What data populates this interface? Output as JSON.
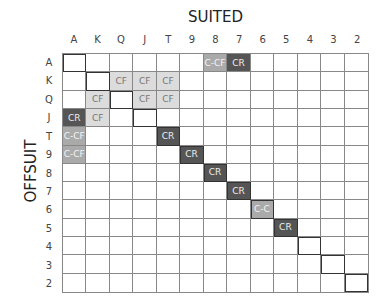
{
  "title_top": "SUITED",
  "title_left": "OFFSUIT",
  "ranks": [
    "A",
    "K",
    "Q",
    "J",
    "T",
    "9",
    "8",
    "7",
    "6",
    "5",
    "4",
    "3",
    "2"
  ],
  "shades": {
    "CR": "dark",
    "C-C": "mid",
    "C-CF": "mid",
    "CF": "light"
  },
  "colors": {
    "dark": "#555555",
    "mid": "#aaaaaa",
    "light": "#dcdcdc",
    "grid": "#888888"
  },
  "cells": [
    {
      "row": "A",
      "col": "8",
      "label": "C-CF"
    },
    {
      "row": "A",
      "col": "7",
      "label": "CR"
    },
    {
      "row": "K",
      "col": "Q",
      "label": "CF"
    },
    {
      "row": "K",
      "col": "J",
      "label": "CF"
    },
    {
      "row": "K",
      "col": "T",
      "label": "CF"
    },
    {
      "row": "Q",
      "col": "K",
      "label": "CF"
    },
    {
      "row": "Q",
      "col": "J",
      "label": "CF"
    },
    {
      "row": "Q",
      "col": "T",
      "label": "CF"
    },
    {
      "row": "J",
      "col": "A",
      "label": "CR"
    },
    {
      "row": "J",
      "col": "K",
      "label": "CF"
    },
    {
      "row": "T",
      "col": "A",
      "label": "C-CF"
    },
    {
      "row": "T",
      "col": "T",
      "label": "CR"
    },
    {
      "row": "9",
      "col": "A",
      "label": "C-CF"
    },
    {
      "row": "9",
      "col": "9",
      "label": "CR"
    },
    {
      "row": "8",
      "col": "8",
      "label": "CR"
    },
    {
      "row": "7",
      "col": "7",
      "label": "CR"
    },
    {
      "row": "6",
      "col": "6",
      "label": "C-C"
    },
    {
      "row": "5",
      "col": "5",
      "label": "CR"
    }
  ]
}
